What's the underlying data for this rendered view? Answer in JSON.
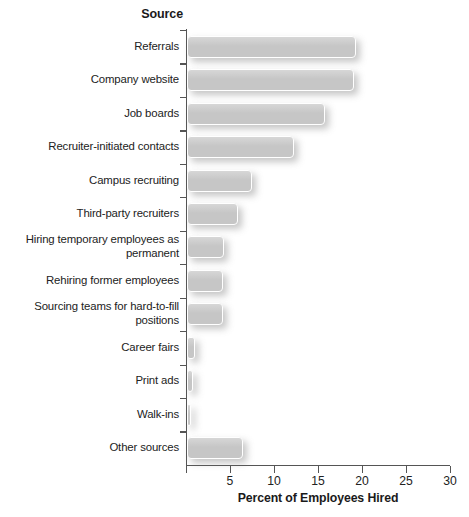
{
  "chart_data": {
    "type": "bar",
    "orientation": "horizontal",
    "title": "",
    "category_axis_title": "Source",
    "xlabel": "Percent of Employees Hired",
    "ylabel": "Source",
    "xlim": [
      0,
      30
    ],
    "xticks": [
      0,
      5,
      10,
      15,
      20,
      25,
      30
    ],
    "xtick_labels": [
      "",
      "5",
      "10",
      "15",
      "20",
      "25",
      "30"
    ],
    "grid": false,
    "legend": null,
    "bar_color": "#c6c6c6",
    "categories": [
      "Referrals",
      "Company website",
      "Job boards",
      "Recruiter-initiated contacts",
      "Campus recruiting",
      "Third-party recruiters",
      "Hiring temporary employees as\npermanent",
      "Rehiring former employees",
      "Sourcing teams for hard-to-fill\npositions",
      "Career fairs",
      "Print ads",
      "Walk-ins",
      "Other sources"
    ],
    "values": [
      19.2,
      19.0,
      15.7,
      12.2,
      7.4,
      5.8,
      4.2,
      4.1,
      4.1,
      0.9,
      0.7,
      0.5,
      6.4
    ]
  }
}
